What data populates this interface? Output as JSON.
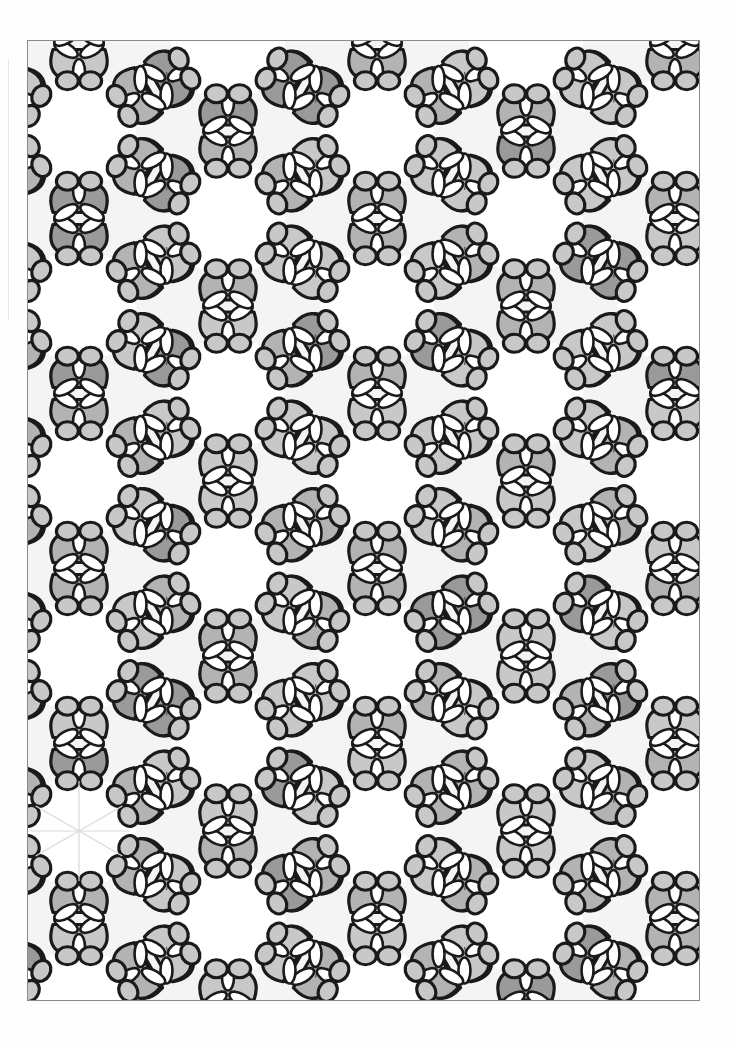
{
  "page": {
    "type": "coloring-page-scan",
    "visible_text": []
  },
  "frame": {
    "left": 27,
    "top": 40,
    "right": 700,
    "bottom": 1001,
    "border_color": "#8a8a8a"
  },
  "pattern": {
    "lattice": {
      "col_spacing": 149,
      "row_spacing": 175,
      "odd_column_offset": 87.5,
      "origin_x": 78,
      "origin_y": 130
    },
    "motifs": [
      {
        "name": "hexagon-ring",
        "fill": "#ffffff",
        "beads_per_side": 2
      },
      {
        "name": "heart-lobe",
        "fill": "#b9b9b9"
      },
      {
        "name": "bead",
        "fill": "#d2d2d2"
      },
      {
        "name": "leaf-trefoil",
        "fill": "#ffffff"
      }
    ],
    "colors": {
      "outline": "#1a1a1a",
      "shade_light": "#c8c8c8",
      "shade_mid": "#b3b3b3",
      "shade_dark": "#9a9a9a",
      "background": "#f4f4f4",
      "pencil_guides": "#d9d9d9"
    },
    "pencil_guide_star": {
      "x": 78,
      "y": 830
    }
  }
}
